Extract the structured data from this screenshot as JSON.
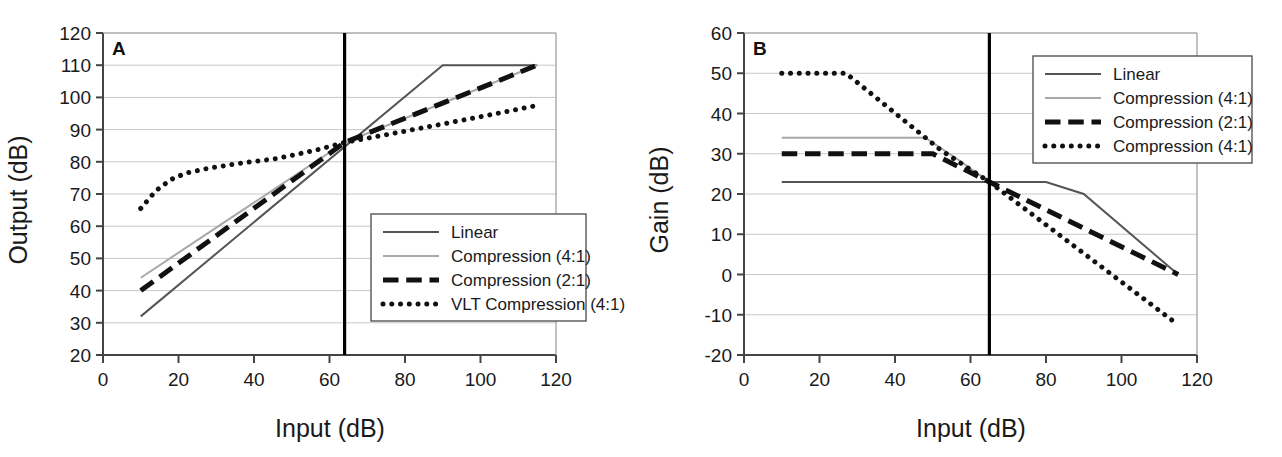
{
  "figure": {
    "background": "#ffffff",
    "panels": [
      "A",
      "B"
    ]
  },
  "chart_data": [
    {
      "type": "line",
      "panel_label": "A",
      "title": "",
      "xlabel": "Input (dB)",
      "ylabel": "Output (dB)",
      "xlim": [
        0,
        120
      ],
      "ylim": [
        20,
        120
      ],
      "xticks": [
        0,
        20,
        40,
        60,
        80,
        100,
        120
      ],
      "yticks": [
        20,
        30,
        40,
        50,
        60,
        70,
        80,
        90,
        100,
        110,
        120
      ],
      "grid": "horizontal",
      "legend_position": "bottom-right",
      "annotations": [
        {
          "name": "threshold-line",
          "type": "vline",
          "x": 64,
          "color": "#000000",
          "label": ""
        }
      ],
      "series": [
        {
          "name": "Linear",
          "style": "solid",
          "color": "#555555",
          "width": 2,
          "x": [
            10,
            90,
            115
          ],
          "y": [
            32,
            110,
            110
          ]
        },
        {
          "name": "Compression (4:1)",
          "style": "solid",
          "color": "#a8a8a8",
          "width": 2,
          "x": [
            10,
            64,
            115
          ],
          "y": [
            44,
            86,
            110
          ]
        },
        {
          "name": "Compression (2:1)",
          "style": "dashed",
          "color": "#111111",
          "width": 5,
          "x": [
            10,
            64,
            115
          ],
          "y": [
            40,
            86,
            110
          ]
        },
        {
          "name": "VLT Compression (4:1)",
          "style": "dotted",
          "color": "#111111",
          "width": 5,
          "x": [
            10,
            14,
            18,
            22,
            28,
            36,
            46,
            56,
            64,
            80,
            100,
            115
          ],
          "y": [
            65.5,
            71,
            74.5,
            76.5,
            78,
            79.5,
            81,
            83.5,
            86,
            89.5,
            94,
            97.5
          ]
        }
      ]
    },
    {
      "type": "line",
      "panel_label": "B",
      "title": "",
      "xlabel": "Input (dB)",
      "ylabel": "Gain (dB)",
      "xlim": [
        0,
        120
      ],
      "ylim": [
        -20,
        60
      ],
      "xticks": [
        0,
        20,
        40,
        60,
        80,
        100,
        120
      ],
      "yticks": [
        -20,
        -10,
        0,
        10,
        20,
        30,
        40,
        50,
        60
      ],
      "grid": "horizontal",
      "legend_position": "top-right",
      "annotations": [
        {
          "name": "threshold-line",
          "type": "vline",
          "x": 65,
          "color": "#000000",
          "label": ""
        }
      ],
      "series": [
        {
          "name": "Linear",
          "style": "solid",
          "color": "#555555",
          "width": 2,
          "x": [
            10,
            80,
            90,
            115
          ],
          "y": [
            23,
            23,
            20,
            0
          ]
        },
        {
          "name": "Compression (4:1)",
          "style": "solid",
          "color": "#a8a8a8",
          "width": 2,
          "x": [
            10,
            48,
            56,
            65
          ],
          "y": [
            34,
            34,
            29,
            23
          ]
        },
        {
          "name": "Compression (2:1)",
          "style": "dashed",
          "color": "#111111",
          "width": 5,
          "x": [
            10,
            50,
            65,
            115
          ],
          "y": [
            30,
            30,
            23,
            0
          ]
        },
        {
          "name": "Compression (4:1)",
          "style": "dotted",
          "color": "#111111",
          "width": 5,
          "x": [
            10,
            27,
            52,
            65,
            115
          ],
          "y": [
            50,
            50,
            31,
            23,
            -12.5
          ]
        }
      ]
    }
  ],
  "panel_a": {
    "letter": "A",
    "ylabel": "Output (dB)",
    "xlabel": "Input (dB)",
    "yticks": [
      "120",
      "110",
      "100",
      "90",
      "80",
      "70",
      "60",
      "50",
      "40",
      "30",
      "20"
    ],
    "xticks": [
      "0",
      "20",
      "40",
      "60",
      "80",
      "100",
      "120"
    ],
    "legend": [
      {
        "label": "Linear",
        "style": "solid",
        "color": "#555555"
      },
      {
        "label": "Compression (4:1)",
        "style": "solid",
        "color": "#a8a8a8"
      },
      {
        "label": "Compression (2:1)",
        "style": "dashed",
        "color": "#111111"
      },
      {
        "label": "VLT Compression (4:1)",
        "style": "dotted",
        "color": "#111111"
      }
    ]
  },
  "panel_b": {
    "letter": "B",
    "ylabel": "Gain (dB)",
    "xlabel": "Input (dB)",
    "yticks": [
      "60",
      "50",
      "40",
      "30",
      "20",
      "10",
      "0",
      "-10",
      "-20"
    ],
    "xticks": [
      "0",
      "20",
      "40",
      "60",
      "80",
      "100",
      "120"
    ],
    "legend": [
      {
        "label": "Linear",
        "style": "solid",
        "color": "#555555"
      },
      {
        "label": "Compression (4:1)",
        "style": "solid",
        "color": "#a8a8a8"
      },
      {
        "label": "Compression (2:1)",
        "style": "dashed",
        "color": "#111111"
      },
      {
        "label": "Compression (4:1)",
        "style": "dotted",
        "color": "#111111"
      }
    ]
  },
  "colors": {
    "linear": "#555555",
    "compression_4_1": "#a8a8a8",
    "compression_2_1": "#111111",
    "vlt": "#111111",
    "axis": "#555555",
    "grid": "#c8c8c8",
    "threshold": "#000000",
    "background": "#ffffff"
  }
}
